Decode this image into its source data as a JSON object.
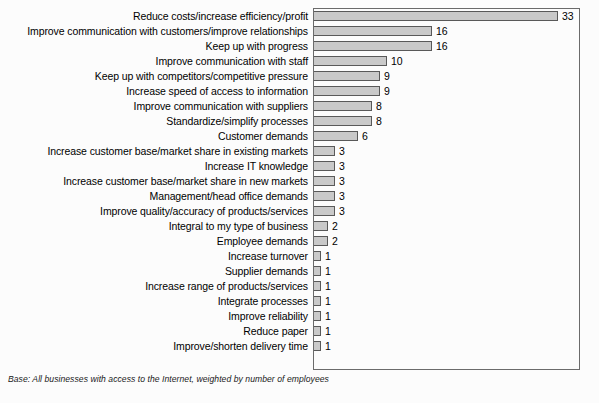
{
  "footnote": "Base: All businesses with access to the Internet, weighted by number of employees",
  "colors": {
    "bar_fill": "#c9c9c9",
    "bar_border": "#595959",
    "frame": "#6b6b6b",
    "text": "#000000",
    "background": "#fcfcfc"
  },
  "chart_data": {
    "type": "bar",
    "orientation": "horizontal",
    "title": "",
    "subtitle": "",
    "xlabel": "",
    "ylabel": "",
    "xlim": [
      0,
      36
    ],
    "grid": false,
    "legend": null,
    "annotation": "Base: All businesses with access to the Internet, weighted by number of employees",
    "value_labels": true,
    "categories": [
      "Reduce costs/increase efficiency/profit",
      "Improve communication with customers/improve relationships",
      "Keep up with progress",
      "Improve communication with staff",
      "Keep up with competitors/competitive pressure",
      "Increase speed of access to information",
      "Improve communication with suppliers",
      "Standardize/simplify processes",
      "Customer demands",
      "Increase customer base/market share in existing markets",
      "Increase IT knowledge",
      "Increase customer base/market share in new markets",
      "Management/head office demands",
      "Improve quality/accuracy of products/services",
      "Integral to my type of business",
      "Employee demands",
      "Increase turnover",
      "Supplier demands",
      "Increase range of products/services",
      "Integrate processes",
      "Improve reliability",
      "Reduce paper",
      "Improve/shorten delivery time"
    ],
    "values": [
      33,
      16,
      16,
      10,
      9,
      9,
      8,
      8,
      6,
      3,
      3,
      3,
      3,
      3,
      2,
      2,
      1,
      1,
      1,
      1,
      1,
      1,
      1
    ]
  }
}
